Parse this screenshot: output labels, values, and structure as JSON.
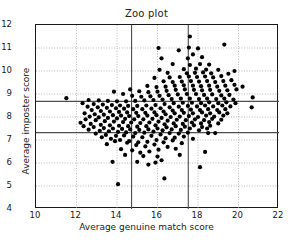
{
  "chart_data": {
    "type": "scatter",
    "title": "Zoo plot",
    "xlabel": "Average genuine match score",
    "ylabel": "Average imposter score",
    "xlim": [
      10,
      22
    ],
    "ylim": [
      12,
      4
    ],
    "y_inverted": true,
    "xticks": [
      10,
      12,
      14,
      16,
      18,
      20,
      22
    ],
    "yticks": [
      4,
      5,
      6,
      7,
      8,
      9,
      10,
      11,
      12
    ],
    "grid": true,
    "grid_style": "dotted",
    "legend": null,
    "marker": {
      "shape": "circle",
      "color": "#000000",
      "size": 3.1
    },
    "reference_lines": [
      {
        "name": "goats-threshold-vertical",
        "orientation": "vertical",
        "x": 14.72,
        "y_from": 4.0,
        "y_to": 12.0
      },
      {
        "name": "wolves-threshold-vertical",
        "orientation": "vertical",
        "x": 17.52,
        "y_from": 4.0,
        "y_to": 12.0
      },
      {
        "name": "lambs-threshold-horizontal",
        "orientation": "horizontal",
        "y": 7.32,
        "x_from": 10.0,
        "x_to": 22.0
      },
      {
        "name": "doves-threshold-horizontal",
        "orientation": "horizontal",
        "y": 8.68,
        "x_from": 10.0,
        "x_to": 22.0
      }
    ],
    "points": [
      [
        14.05,
        5.08
      ],
      [
        16.34,
        5.33
      ],
      [
        13.78,
        6.05
      ],
      [
        18.1,
        5.82
      ],
      [
        15.0,
        6.05
      ],
      [
        15.55,
        5.93
      ],
      [
        15.9,
        6.02
      ],
      [
        16.2,
        6.12
      ],
      [
        14.4,
        6.35
      ],
      [
        15.3,
        6.3
      ],
      [
        16.0,
        6.28
      ],
      [
        17.1,
        6.35
      ],
      [
        13.5,
        6.82
      ],
      [
        14.2,
        6.6
      ],
      [
        14.75,
        6.55
      ],
      [
        15.15,
        6.45
      ],
      [
        15.6,
        6.5
      ],
      [
        16.05,
        6.58
      ],
      [
        16.5,
        6.7
      ],
      [
        16.9,
        6.62
      ],
      [
        18.35,
        6.48
      ],
      [
        13.9,
        6.95
      ],
      [
        14.5,
        6.88
      ],
      [
        14.95,
        6.78
      ],
      [
        15.4,
        6.72
      ],
      [
        15.85,
        6.8
      ],
      [
        16.3,
        6.9
      ],
      [
        16.75,
        6.98
      ],
      [
        17.2,
        6.86
      ],
      [
        13.25,
        7.12
      ],
      [
        13.7,
        7.05
      ],
      [
        14.15,
        7.0
      ],
      [
        14.6,
        6.95
      ],
      [
        15.05,
        6.9
      ],
      [
        15.5,
        6.92
      ],
      [
        15.95,
        7.0
      ],
      [
        16.4,
        7.08
      ],
      [
        16.85,
        7.1
      ],
      [
        17.3,
        7.15
      ],
      [
        17.75,
        7.05
      ],
      [
        12.95,
        7.28
      ],
      [
        13.45,
        7.22
      ],
      [
        13.95,
        7.18
      ],
      [
        14.35,
        7.2
      ],
      [
        14.8,
        7.15
      ],
      [
        15.25,
        7.12
      ],
      [
        15.7,
        7.18
      ],
      [
        16.15,
        7.24
      ],
      [
        16.6,
        7.3
      ],
      [
        17.05,
        7.28
      ],
      [
        17.5,
        7.32
      ],
      [
        18.5,
        7.3
      ],
      [
        18.85,
        7.3
      ],
      [
        12.6,
        7.45
      ],
      [
        13.15,
        7.4
      ],
      [
        13.6,
        7.38
      ],
      [
        14.05,
        7.35
      ],
      [
        14.45,
        7.33
      ],
      [
        14.9,
        7.3
      ],
      [
        15.35,
        7.32
      ],
      [
        15.8,
        7.36
      ],
      [
        16.25,
        7.42
      ],
      [
        16.7,
        7.46
      ],
      [
        17.15,
        7.44
      ],
      [
        17.6,
        7.5
      ],
      [
        18.05,
        7.42
      ],
      [
        18.45,
        7.5
      ],
      [
        12.35,
        7.6
      ],
      [
        12.85,
        7.56
      ],
      [
        13.35,
        7.52
      ],
      [
        13.8,
        7.5
      ],
      [
        14.25,
        7.48
      ],
      [
        14.65,
        7.46
      ],
      [
        15.1,
        7.44
      ],
      [
        15.55,
        7.46
      ],
      [
        16.0,
        7.5
      ],
      [
        16.45,
        7.55
      ],
      [
        16.9,
        7.6
      ],
      [
        17.35,
        7.58
      ],
      [
        17.8,
        7.64
      ],
      [
        18.2,
        7.56
      ],
      [
        18.6,
        7.62
      ],
      [
        12.2,
        7.75
      ],
      [
        12.7,
        7.7
      ],
      [
        13.2,
        7.66
      ],
      [
        13.65,
        7.64
      ],
      [
        14.1,
        7.62
      ],
      [
        14.55,
        7.6
      ],
      [
        15.0,
        7.58
      ],
      [
        15.45,
        7.6
      ],
      [
        15.9,
        7.64
      ],
      [
        16.35,
        7.68
      ],
      [
        16.8,
        7.72
      ],
      [
        17.25,
        7.7
      ],
      [
        17.7,
        7.76
      ],
      [
        18.15,
        7.72
      ],
      [
        18.55,
        7.78
      ],
      [
        19.0,
        7.72
      ],
      [
        12.45,
        7.9
      ],
      [
        12.95,
        7.86
      ],
      [
        13.4,
        7.82
      ],
      [
        13.85,
        7.8
      ],
      [
        14.3,
        7.78
      ],
      [
        14.7,
        7.76
      ],
      [
        15.15,
        7.74
      ],
      [
        15.6,
        7.76
      ],
      [
        16.05,
        7.8
      ],
      [
        16.5,
        7.84
      ],
      [
        16.95,
        7.88
      ],
      [
        17.4,
        7.86
      ],
      [
        17.85,
        7.9
      ],
      [
        18.3,
        7.86
      ],
      [
        18.7,
        7.92
      ],
      [
        19.15,
        7.88
      ],
      [
        12.65,
        8.02
      ],
      [
        13.1,
        7.98
      ],
      [
        13.55,
        7.96
      ],
      [
        14.0,
        7.94
      ],
      [
        14.4,
        7.92
      ],
      [
        14.85,
        7.9
      ],
      [
        15.3,
        7.9
      ],
      [
        15.75,
        7.92
      ],
      [
        16.2,
        7.96
      ],
      [
        16.65,
        8.0
      ],
      [
        17.1,
        8.02
      ],
      [
        17.55,
        8.04
      ],
      [
        18.0,
        8.0
      ],
      [
        18.4,
        8.06
      ],
      [
        18.8,
        8.02
      ],
      [
        19.25,
        8.06
      ],
      [
        12.4,
        8.16
      ],
      [
        12.9,
        8.12
      ],
      [
        13.35,
        8.1
      ],
      [
        13.8,
        8.08
      ],
      [
        14.2,
        8.06
      ],
      [
        14.6,
        8.04
      ],
      [
        15.05,
        8.04
      ],
      [
        15.5,
        8.06
      ],
      [
        15.95,
        8.08
      ],
      [
        16.4,
        8.12
      ],
      [
        16.85,
        8.16
      ],
      [
        17.3,
        8.18
      ],
      [
        17.75,
        8.16
      ],
      [
        18.2,
        8.2
      ],
      [
        18.6,
        8.16
      ],
      [
        19.05,
        8.2
      ],
      [
        19.45,
        8.16
      ],
      [
        12.75,
        8.3
      ],
      [
        13.2,
        8.26
      ],
      [
        13.65,
        8.24
      ],
      [
        14.1,
        8.22
      ],
      [
        14.5,
        8.2
      ],
      [
        14.95,
        8.18
      ],
      [
        15.4,
        8.18
      ],
      [
        15.85,
        8.2
      ],
      [
        16.3,
        8.24
      ],
      [
        16.75,
        8.28
      ],
      [
        17.2,
        8.3
      ],
      [
        17.65,
        8.32
      ],
      [
        18.1,
        8.3
      ],
      [
        18.5,
        8.34
      ],
      [
        18.95,
        8.3
      ],
      [
        19.35,
        8.34
      ],
      [
        20.65,
        8.42
      ],
      [
        12.55,
        8.45
      ],
      [
        13.05,
        8.42
      ],
      [
        13.5,
        8.4
      ],
      [
        13.95,
        8.38
      ],
      [
        14.35,
        8.36
      ],
      [
        14.8,
        8.34
      ],
      [
        15.25,
        8.34
      ],
      [
        15.7,
        8.36
      ],
      [
        16.15,
        8.38
      ],
      [
        16.6,
        8.42
      ],
      [
        17.05,
        8.45
      ],
      [
        17.5,
        8.48
      ],
      [
        17.95,
        8.46
      ],
      [
        18.35,
        8.5
      ],
      [
        18.75,
        8.46
      ],
      [
        19.2,
        8.5
      ],
      [
        19.6,
        8.46
      ],
      [
        12.3,
        8.6
      ],
      [
        12.85,
        8.56
      ],
      [
        13.3,
        8.54
      ],
      [
        13.75,
        8.52
      ],
      [
        14.15,
        8.5
      ],
      [
        14.55,
        8.48
      ],
      [
        15.0,
        8.48
      ],
      [
        15.45,
        8.5
      ],
      [
        15.9,
        8.52
      ],
      [
        16.35,
        8.56
      ],
      [
        16.8,
        8.6
      ],
      [
        17.25,
        8.62
      ],
      [
        17.7,
        8.62
      ],
      [
        18.15,
        8.6
      ],
      [
        18.55,
        8.64
      ],
      [
        19.0,
        8.6
      ],
      [
        19.4,
        8.64
      ],
      [
        19.85,
        8.6
      ],
      [
        11.5,
        8.82
      ],
      [
        12.6,
        8.74
      ],
      [
        13.1,
        8.72
      ],
      [
        13.55,
        8.7
      ],
      [
        14.0,
        8.68
      ],
      [
        14.45,
        8.68
      ],
      [
        14.9,
        8.7
      ],
      [
        15.35,
        8.72
      ],
      [
        15.8,
        8.74
      ],
      [
        16.25,
        8.76
      ],
      [
        16.7,
        8.78
      ],
      [
        17.15,
        8.8
      ],
      [
        17.6,
        8.8
      ],
      [
        18.05,
        8.78
      ],
      [
        18.45,
        8.8
      ],
      [
        18.9,
        8.78
      ],
      [
        19.3,
        8.8
      ],
      [
        19.75,
        8.76
      ],
      [
        20.7,
        8.85
      ],
      [
        13.85,
        9.1
      ],
      [
        14.3,
        9.0
      ],
      [
        14.75,
        8.92
      ],
      [
        15.2,
        8.88
      ],
      [
        15.65,
        8.9
      ],
      [
        16.1,
        8.92
      ],
      [
        16.55,
        8.95
      ],
      [
        17.0,
        8.98
      ],
      [
        17.45,
        9.0
      ],
      [
        17.9,
        9.0
      ],
      [
        18.3,
        8.96
      ],
      [
        18.7,
        8.98
      ],
      [
        19.15,
        8.94
      ],
      [
        19.55,
        8.96
      ],
      [
        14.65,
        9.2
      ],
      [
        15.1,
        9.12
      ],
      [
        15.55,
        9.08
      ],
      [
        16.0,
        9.1
      ],
      [
        16.45,
        9.14
      ],
      [
        16.9,
        9.18
      ],
      [
        17.35,
        9.2
      ],
      [
        17.8,
        9.18
      ],
      [
        18.2,
        9.16
      ],
      [
        18.6,
        9.18
      ],
      [
        19.05,
        9.14
      ],
      [
        19.45,
        9.16
      ],
      [
        19.9,
        9.2
      ],
      [
        15.5,
        9.35
      ],
      [
        15.95,
        9.3
      ],
      [
        16.4,
        9.32
      ],
      [
        16.85,
        9.36
      ],
      [
        17.3,
        9.38
      ],
      [
        17.75,
        9.36
      ],
      [
        18.15,
        9.34
      ],
      [
        18.55,
        9.36
      ],
      [
        18.95,
        9.32
      ],
      [
        19.35,
        9.36
      ],
      [
        19.8,
        9.4
      ],
      [
        20.2,
        9.32
      ],
      [
        16.3,
        9.55
      ],
      [
        16.75,
        9.52
      ],
      [
        17.2,
        9.54
      ],
      [
        17.65,
        9.56
      ],
      [
        18.05,
        9.54
      ],
      [
        18.45,
        9.56
      ],
      [
        18.85,
        9.52
      ],
      [
        19.25,
        9.56
      ],
      [
        19.65,
        9.6
      ],
      [
        15.85,
        9.7
      ],
      [
        16.6,
        9.72
      ],
      [
        17.1,
        9.74
      ],
      [
        17.55,
        9.76
      ],
      [
        17.95,
        9.74
      ],
      [
        18.35,
        9.76
      ],
      [
        18.75,
        9.72
      ],
      [
        19.15,
        9.78
      ],
      [
        16.5,
        9.92
      ],
      [
        17.45,
        9.9
      ],
      [
        17.85,
        9.92
      ],
      [
        18.25,
        9.94
      ],
      [
        18.65,
        9.9
      ],
      [
        19.5,
        9.88
      ],
      [
        16.1,
        10.05
      ],
      [
        17.3,
        10.08
      ],
      [
        17.9,
        10.1
      ],
      [
        18.4,
        10.06
      ],
      [
        19.0,
        10.05
      ],
      [
        19.8,
        10.0
      ],
      [
        16.75,
        10.3
      ],
      [
        17.6,
        10.26
      ],
      [
        18.1,
        10.3
      ],
      [
        18.55,
        10.28
      ],
      [
        16.2,
        10.55
      ],
      [
        17.5,
        10.55
      ],
      [
        18.2,
        10.6
      ],
      [
        17.75,
        10.72
      ],
      [
        16.05,
        11.0
      ],
      [
        17.05,
        10.9
      ],
      [
        17.55,
        11.02
      ],
      [
        18.0,
        10.98
      ],
      [
        19.3,
        11.15
      ],
      [
        17.6,
        11.5
      ]
    ]
  }
}
